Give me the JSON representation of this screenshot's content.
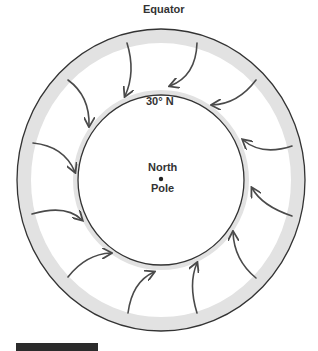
{
  "diagram": {
    "title": "",
    "labels": {
      "equator": "Equator",
      "latitude": "30° N",
      "pole_line1": "North",
      "pole_line2": "Pole"
    },
    "colors": {
      "outline": "#333333",
      "band": "#e2e2e2",
      "arrow": "#4a4a4a",
      "background": "#ffffff"
    },
    "rings": [
      {
        "name": "equator",
        "cx": 161,
        "cy": 180,
        "rx": 144,
        "ry": 151,
        "band_width": 14
      },
      {
        "name": "30N",
        "cx": 161,
        "cy": 180,
        "rx": 83,
        "ry": 85,
        "band_width": 4
      }
    ],
    "arrows": [
      {
        "id": 1,
        "from": [
          127,
          43
        ],
        "to": [
          125,
          96
        ],
        "direction": "inward"
      },
      {
        "id": 2,
        "from": [
          197,
          43
        ],
        "to": [
          170,
          86
        ],
        "direction": "inward"
      },
      {
        "id": 3,
        "from": [
          256,
          80
        ],
        "to": [
          212,
          105
        ],
        "direction": "inward"
      },
      {
        "id": 4,
        "from": [
          292,
          146
        ],
        "to": [
          243,
          140
        ],
        "direction": "inward"
      },
      {
        "id": 5,
        "from": [
          292,
          216
        ],
        "to": [
          252,
          188
        ],
        "direction": "inward"
      },
      {
        "id": 6,
        "from": [
          256,
          278
        ],
        "to": [
          233,
          232
        ],
        "direction": "inward"
      },
      {
        "id": 7,
        "from": [
          197,
          313
        ],
        "to": [
          197,
          263
        ],
        "direction": "inward"
      },
      {
        "id": 8,
        "from": [
          128,
          313
        ],
        "to": [
          154,
          272
        ],
        "direction": "inward"
      },
      {
        "id": 9,
        "from": [
          68,
          277
        ],
        "to": [
          111,
          253
        ],
        "direction": "inward"
      },
      {
        "id": 10,
        "from": [
          32,
          214
        ],
        "to": [
          82,
          220
        ],
        "direction": "inward"
      },
      {
        "id": 11,
        "from": [
          33,
          143
        ],
        "to": [
          75,
          172
        ],
        "direction": "inward"
      },
      {
        "id": 12,
        "from": [
          68,
          80
        ],
        "to": [
          89,
          126
        ],
        "direction": "inward"
      }
    ]
  }
}
